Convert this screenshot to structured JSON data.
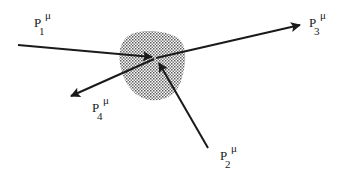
{
  "diagram": {
    "type": "scattering-vertex",
    "colors": {
      "line": "#1a1a1a",
      "blob_dot": "#555555",
      "background": "#ffffff"
    },
    "vertex": {
      "x": 155,
      "y": 58
    },
    "momenta": [
      {
        "id": "p1",
        "base": "P",
        "superscript": "μ",
        "subscript": "1",
        "direction": "incoming",
        "label_pos": {
          "x": 18,
          "y": 14
        }
      },
      {
        "id": "p2",
        "base": "P",
        "superscript": "μ",
        "subscript": "2",
        "direction": "incoming",
        "label_pos": {
          "x": 218,
          "y": 145
        }
      },
      {
        "id": "p3",
        "base": "P",
        "superscript": "μ",
        "subscript": "3",
        "direction": "outgoing",
        "label_pos": {
          "x": 309,
          "y": 12
        }
      },
      {
        "id": "p4",
        "base": "P",
        "superscript": "μ",
        "subscript": "4",
        "direction": "outgoing",
        "label_pos": {
          "x": 91,
          "y": 96
        }
      }
    ]
  }
}
